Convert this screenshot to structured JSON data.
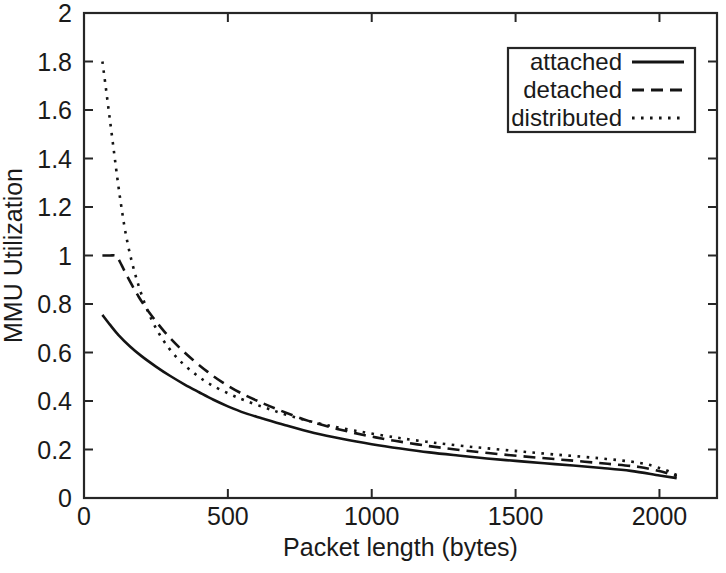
{
  "chart_data": {
    "type": "line",
    "title": "",
    "xlabel": "Packet length (bytes)",
    "ylabel": "MMU Utilization",
    "xlim": [
      0,
      2200
    ],
    "ylim": [
      0,
      2
    ],
    "xticks": [
      0,
      500,
      1000,
      1500,
      2000
    ],
    "xticklabels": [
      "0",
      "500",
      "1000",
      "1500",
      "2000"
    ],
    "yticks": [
      0,
      0.2,
      0.4,
      0.6,
      0.8,
      1,
      1.2,
      1.4,
      1.6,
      1.8,
      2
    ],
    "yticklabels": [
      "0",
      "0.2",
      "0.4",
      "0.6",
      "0.8",
      "1",
      "1.2",
      "1.4",
      "1.6",
      "1.8",
      "2"
    ],
    "grid": false,
    "legend_position": "top-right",
    "series": [
      {
        "name": "attached",
        "style": "solid",
        "dash": "none",
        "color": "#141414",
        "x": [
          64,
          90,
          120,
          160,
          200,
          250,
          300,
          350,
          400,
          450,
          500,
          560,
          620,
          700,
          800,
          900,
          1000,
          1100,
          1200,
          1300,
          1400,
          1500,
          1600,
          1700,
          1800,
          1900,
          2000,
          2060
        ],
        "y": [
          0.755,
          0.715,
          0.672,
          0.625,
          0.585,
          0.542,
          0.503,
          0.468,
          0.436,
          0.405,
          0.378,
          0.35,
          0.328,
          0.3,
          0.268,
          0.243,
          0.222,
          0.204,
          0.188,
          0.175,
          0.163,
          0.153,
          0.143,
          0.134,
          0.124,
          0.112,
          0.093,
          0.082
        ]
      },
      {
        "name": "detached",
        "style": "dashed",
        "dash": "12,7",
        "color": "#141414",
        "x": [
          64,
          90,
          110,
          120,
          150,
          190,
          230,
          280,
          330,
          380,
          430,
          480,
          540,
          600,
          680,
          780,
          880,
          980,
          1080,
          1200,
          1320,
          1450,
          1580,
          1700,
          1820,
          1930,
          2010,
          2060
        ],
        "y": [
          1.0,
          1.0,
          1.0,
          0.985,
          0.915,
          0.83,
          0.76,
          0.685,
          0.622,
          0.568,
          0.52,
          0.478,
          0.436,
          0.402,
          0.362,
          0.318,
          0.285,
          0.258,
          0.236,
          0.214,
          0.196,
          0.18,
          0.166,
          0.154,
          0.141,
          0.128,
          0.108,
          0.09
        ]
      },
      {
        "name": "distributed",
        "style": "dotted",
        "dash": "2.6,6.4",
        "color": "#141414",
        "x": [
          64,
          75,
          90,
          105,
          118,
          130,
          145,
          165,
          190,
          220,
          255,
          295,
          340,
          390,
          440,
          500,
          560,
          640,
          730,
          830,
          940,
          1060,
          1190,
          1330,
          1480,
          1630,
          1790,
          1930,
          2010,
          2060
        ],
        "y": [
          1.8,
          1.7,
          1.56,
          1.42,
          1.3,
          1.2,
          1.09,
          0.98,
          0.875,
          0.775,
          0.69,
          0.618,
          0.558,
          0.508,
          0.468,
          0.432,
          0.402,
          0.368,
          0.334,
          0.304,
          0.278,
          0.254,
          0.232,
          0.213,
          0.196,
          0.18,
          0.164,
          0.145,
          0.12,
          0.095
        ]
      }
    ],
    "legend": [
      {
        "label": "attached",
        "style": "solid",
        "dash": "none"
      },
      {
        "label": "detached",
        "style": "dashed",
        "dash": "12,7"
      },
      {
        "label": "distributed",
        "style": "dotted",
        "dash": "2.6,6.4"
      }
    ]
  },
  "geometry": {
    "plot_left": 84,
    "plot_right": 717,
    "plot_top": 13,
    "plot_bottom": 498,
    "legend_x": 508,
    "legend_y": 48,
    "legend_w": 187,
    "legend_h": 84
  }
}
